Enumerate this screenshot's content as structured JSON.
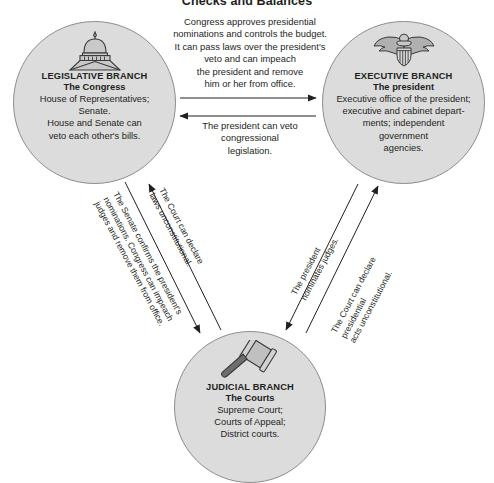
{
  "title": "Checks and Balances",
  "branches": {
    "legislative": {
      "icon": "capitol-dome-icon",
      "name": "LEGISLATIVE BRANCH",
      "subtitle": "The Congress",
      "body": "House of Representatives;\nSenate.\nHouse and Senate can\nveto each other's bills."
    },
    "executive": {
      "icon": "eagle-seal-icon",
      "name": "EXECUTIVE BRANCH",
      "subtitle": "The president",
      "body": "Executive office of the president;\nexecutive and cabinet depart-\nments; independent\ngovernment\nagencies."
    },
    "judicial": {
      "icon": "gavel-icon",
      "name": "JUDICIAL BRANCH",
      "subtitle": "The Courts",
      "body": "Supreme Court;\nCourts of Appeal;\nDistrict courts."
    }
  },
  "relations": {
    "legislative_to_executive": "Congress approves presidential\nnominations and controls the budget.\nIt can pass laws over the president's\nveto and can impeach\nthe president and remove\nhim or her from office.",
    "executive_to_legislative": "The president can veto\ncongressional\nlegislation.",
    "judicial_to_legislative": "The Court can declare\nlaws unconstitutional.",
    "legislative_to_judicial": "The Senate confirms the president's\nnominations. Congress can impeach\njudges and remove them from office.",
    "executive_to_judicial": "The president\nnominates judges.",
    "judicial_to_executive": "The Court can declare\npresidential\nacts unconstitutional."
  },
  "colors": {
    "circle_fill": "#dcdcdc",
    "circle_stroke": "#8d8d8d",
    "text": "#231f20",
    "icon_fill": "#b8b8b8",
    "icon_stroke": "#3a3a3a"
  }
}
